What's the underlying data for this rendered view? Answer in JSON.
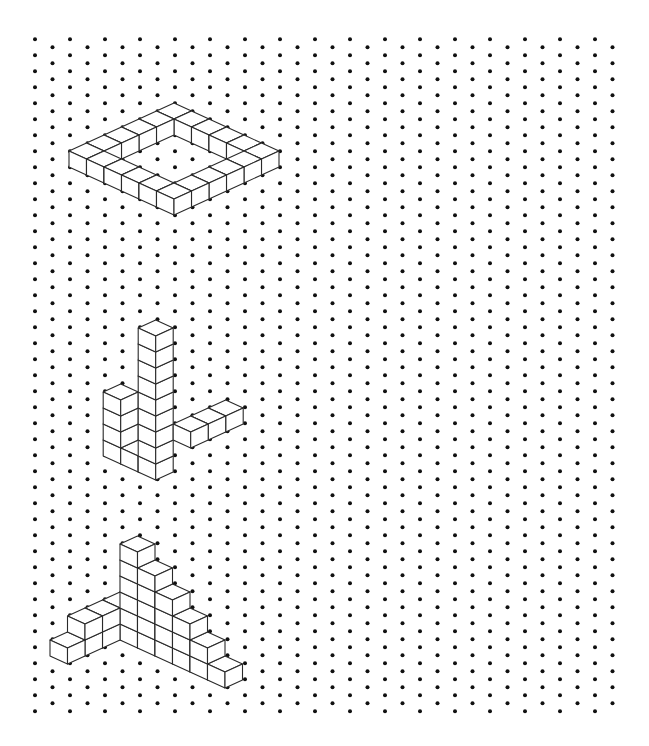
{
  "page": {
    "width": 649,
    "height": 746,
    "background": "#ffffff"
  },
  "dot_grid": {
    "type": "isometric",
    "origin_x": 35,
    "origin_y": 39.3,
    "column_spacing": 17.5,
    "row_spacing": 16,
    "odd_column_offset": 8,
    "columns": 34,
    "rows_even_columns": 43,
    "rows_odd_columns": 42,
    "dot_radius": 2,
    "dot_color": "#111111"
  },
  "iso_axes": {
    "a": [
      17.5,
      8
    ],
    "b": [
      -17.5,
      8
    ],
    "up": [
      0,
      -16
    ]
  },
  "line_color": "#2a2a2a",
  "shapes": [
    {
      "id": "square-ring",
      "description": "6 x 6 square ring of cubes, one cube wide, one cube high",
      "origin": [
        174,
        119
      ],
      "cubes": [
        [
          0,
          0,
          0
        ],
        [
          1,
          0,
          0
        ],
        [
          2,
          0,
          0
        ],
        [
          3,
          0,
          0
        ],
        [
          4,
          0,
          0
        ],
        [
          5,
          0,
          0
        ],
        [
          0,
          1,
          0
        ],
        [
          5,
          1,
          0
        ],
        [
          0,
          2,
          0
        ],
        [
          5,
          2,
          0
        ],
        [
          0,
          3,
          0
        ],
        [
          5,
          3,
          0
        ],
        [
          0,
          4,
          0
        ],
        [
          5,
          4,
          0
        ],
        [
          0,
          5,
          0
        ],
        [
          1,
          5,
          0
        ],
        [
          2,
          5,
          0
        ],
        [
          3,
          5,
          0
        ],
        [
          4,
          5,
          0
        ],
        [
          5,
          5,
          0
        ]
      ]
    },
    {
      "id": "tower-with-arm",
      "description": "9-cube tower, 4-cube column behind-left, 3-cube horizontal arm to the right",
      "origin": [
        155.7,
        464
      ],
      "cubes": [
        [
          0,
          0,
          0
        ],
        [
          0,
          0,
          1
        ],
        [
          0,
          0,
          2
        ],
        [
          0,
          0,
          3
        ],
        [
          0,
          0,
          4
        ],
        [
          0,
          0,
          5
        ],
        [
          0,
          0,
          6
        ],
        [
          0,
          0,
          7
        ],
        [
          0,
          0,
          8
        ],
        [
          -1,
          0,
          0
        ],
        [
          -2,
          0,
          0
        ],
        [
          -2,
          0,
          1
        ],
        [
          -2,
          0,
          2
        ],
        [
          -2,
          0,
          3
        ],
        [
          1,
          -1,
          2
        ],
        [
          1,
          -2,
          2
        ],
        [
          1,
          -3,
          2
        ]
      ]
    },
    {
      "id": "double-staircase",
      "description": "Staircase of heights 6-5-4-3-2-1 to the right and 2-2-2-1 to the left",
      "origin": [
        137.5,
        632
      ],
      "cubes": [
        [
          0,
          0,
          0
        ],
        [
          0,
          0,
          1
        ],
        [
          0,
          0,
          2
        ],
        [
          0,
          0,
          3
        ],
        [
          0,
          0,
          4
        ],
        [
          0,
          0,
          5
        ],
        [
          1,
          0,
          0
        ],
        [
          1,
          0,
          1
        ],
        [
          1,
          0,
          2
        ],
        [
          1,
          0,
          3
        ],
        [
          1,
          0,
          4
        ],
        [
          2,
          0,
          0
        ],
        [
          2,
          0,
          1
        ],
        [
          2,
          0,
          2
        ],
        [
          2,
          0,
          3
        ],
        [
          3,
          0,
          0
        ],
        [
          3,
          0,
          1
        ],
        [
          3,
          0,
          2
        ],
        [
          4,
          0,
          0
        ],
        [
          4,
          0,
          1
        ],
        [
          5,
          0,
          0
        ],
        [
          -1,
          0,
          0
        ],
        [
          -1,
          0,
          1
        ],
        [
          -1,
          1,
          0
        ],
        [
          -1,
          1,
          1
        ],
        [
          -1,
          2,
          0
        ],
        [
          -1,
          2,
          1
        ],
        [
          -1,
          3,
          0
        ]
      ]
    }
  ]
}
